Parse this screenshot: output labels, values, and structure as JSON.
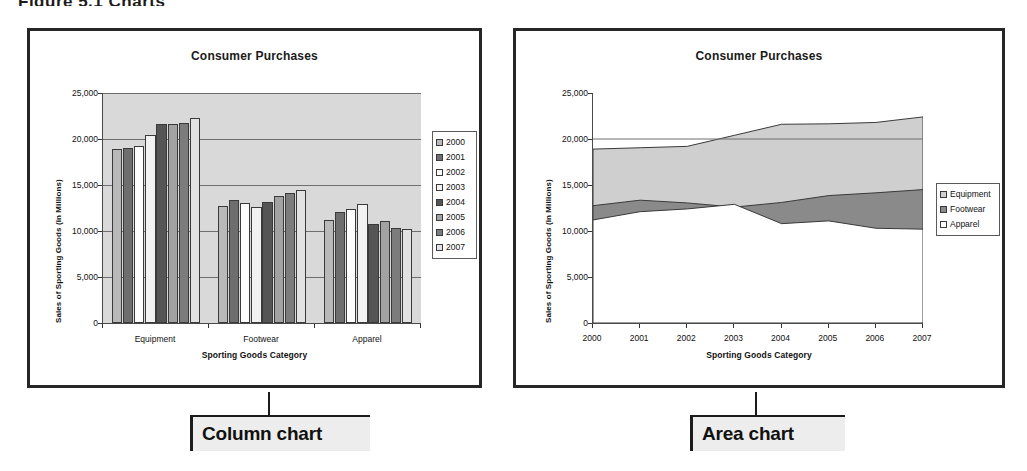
{
  "top_fragment": "Figure 5.1  Charts",
  "captions": {
    "left": "Column chart",
    "right": "Area chart"
  },
  "column_chart": {
    "title": "Consumer Purchases",
    "ylabel": "Sales of Sporting Goods (in Millions)",
    "xlabel": "Sporting Goods Category",
    "yticks": [
      "25,000",
      "20,000",
      "15,000",
      "10,000",
      "5,000",
      "0"
    ],
    "categories": [
      "Equipment",
      "Footwear",
      "Apparel"
    ],
    "legend": [
      "2000",
      "2001",
      "2002",
      "2003",
      "2004",
      "2005",
      "2006",
      "2007"
    ]
  },
  "area_chart": {
    "title": "Consumer Purchases",
    "ylabel": "Sales of Sporting Goods (in Millions)",
    "xlabel": "Sporting Goods Category",
    "yticks": [
      "25,000",
      "20,000",
      "15,000",
      "10,000",
      "5,000",
      "0"
    ],
    "xticks": [
      "2000",
      "2001",
      "2002",
      "2003",
      "2004",
      "2005",
      "2006",
      "2007"
    ],
    "legend": [
      "Equipment",
      "Footwear",
      "Apparel"
    ]
  },
  "chart_data": [
    {
      "type": "bar",
      "title": "Consumer Purchases",
      "xlabel": "Sporting Goods Category",
      "ylabel": "Sales of Sporting Goods (in Millions)",
      "categories": [
        "Equipment",
        "Footwear",
        "Apparel"
      ],
      "ylim": [
        0,
        25000
      ],
      "ytick_values": [
        0,
        5000,
        10000,
        15000,
        20000,
        25000
      ],
      "grid": true,
      "legend_position": "right",
      "series": [
        {
          "name": "2000",
          "values": [
            18900,
            12750,
            11200
          ]
        },
        {
          "name": "2001",
          "values": [
            19000,
            13350,
            12100
          ]
        },
        {
          "name": "2002",
          "values": [
            19200,
            13050,
            12400
          ]
        },
        {
          "name": "2003",
          "values": [
            20400,
            12600,
            12900
          ]
        },
        {
          "name": "2004",
          "values": [
            21600,
            13100,
            10800
          ]
        },
        {
          "name": "2005",
          "values": [
            21600,
            13850,
            11100
          ]
        },
        {
          "name": "2006",
          "values": [
            21700,
            14150,
            10300
          ]
        },
        {
          "name": "2007",
          "values": [
            22300,
            14500,
            10200
          ]
        }
      ]
    },
    {
      "type": "area",
      "title": "Consumer Purchases",
      "xlabel": "Sporting Goods Category",
      "ylabel": "Sales of Sporting Goods (in Millions)",
      "x": [
        "2000",
        "2001",
        "2002",
        "2003",
        "2004",
        "2005",
        "2006",
        "2007"
      ],
      "ylim": [
        0,
        25000
      ],
      "ytick_values": [
        0,
        5000,
        10000,
        15000,
        20000,
        25000
      ],
      "stacked": true,
      "grid": false,
      "legend_position": "right",
      "series": [
        {
          "name": "Apparel",
          "values": [
            11200,
            12100,
            12400,
            12900,
            10800,
            11100,
            10300,
            10200
          ]
        },
        {
          "name": "Footwear",
          "values": [
            12750,
            13350,
            13050,
            12600,
            13100,
            13850,
            14150,
            14500
          ]
        },
        {
          "name": "Equipment",
          "values": [
            18900,
            19050,
            19200,
            20400,
            21600,
            21650,
            21800,
            22400
          ]
        }
      ],
      "note": "series values are cumulative stack tops, in millions"
    }
  ]
}
